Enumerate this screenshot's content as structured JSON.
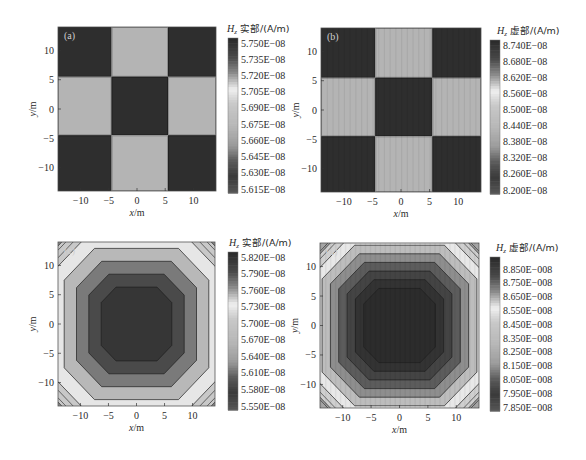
{
  "chart_data": [
    {
      "type": "heatmap",
      "panel": "(a)",
      "pattern": "checkerboard",
      "title": "",
      "xlabel": "x/m",
      "ylabel": "y/m",
      "xlim": [
        -14,
        14
      ],
      "ylim": [
        -14,
        14
      ],
      "xticks": [
        -10,
        -5,
        0,
        5,
        10
      ],
      "yticks": [
        10,
        5,
        0,
        -5,
        -10
      ],
      "colorbar": {
        "title_symbol": "H",
        "title_sub": "z",
        "title_text": " 实部/(A/m)",
        "ticks": [
          "5.750E−08",
          "5.735E−08",
          "5.720E−08",
          "5.705E−08",
          "5.690E−08",
          "5.675E−08",
          "5.660E−08",
          "5.645E−08",
          "5.630E−08",
          "5.615E−08"
        ],
        "min": 5.615e-08,
        "max": 5.75e-08
      },
      "cells": {
        "boundaries": [
          -14,
          -4.5,
          5.5,
          14
        ],
        "values": [
          [
            5.75e-08,
            5.69e-08,
            5.75e-08
          ],
          [
            5.69e-08,
            5.75e-08,
            5.69e-08
          ],
          [
            5.75e-08,
            5.69e-08,
            5.75e-08
          ]
        ]
      },
      "grid": false,
      "legend_position": "right (colorbar)"
    },
    {
      "type": "heatmap",
      "panel": "(b)",
      "pattern": "checkerboard",
      "xlabel": "x/m",
      "ylabel": "y/m",
      "xlim": [
        -14,
        14
      ],
      "ylim": [
        -14,
        14
      ],
      "xticks": [
        -10,
        -5,
        0,
        5,
        10
      ],
      "yticks": [
        10,
        5,
        0,
        -5,
        -10
      ],
      "colorbar": {
        "title_symbol": "H",
        "title_sub": "z",
        "title_text": " 虚部/(A/m)",
        "ticks": [
          "8.740E−08",
          "8.680E−08",
          "8.620E−08",
          "8.560E−08",
          "8.500E−08",
          "8.440E−08",
          "8.380E−08",
          "8.320E−08",
          "8.260E−08",
          "8.200E−08"
        ],
        "min": 8.2e-08,
        "max": 8.74e-08
      },
      "cells": {
        "boundaries": [
          -14,
          -4.5,
          5.5,
          14
        ],
        "values": [
          [
            8.74e-08,
            8.5e-08,
            8.74e-08
          ],
          [
            8.5e-08,
            8.74e-08,
            8.5e-08
          ],
          [
            8.74e-08,
            8.5e-08,
            8.74e-08
          ]
        ]
      },
      "grid": false,
      "legend_position": "right (colorbar)"
    },
    {
      "type": "heatmap",
      "panel": "(c)",
      "pattern": "octagonal contours",
      "xlabel": "x/m",
      "ylabel": "y/m",
      "xlim": [
        -14,
        14
      ],
      "ylim": [
        -14,
        14
      ],
      "xticks": [
        -10,
        -5,
        0,
        5,
        10
      ],
      "yticks": [
        10,
        5,
        0,
        -5,
        -10
      ],
      "colorbar": {
        "title_symbol": "H",
        "title_sub": "z",
        "title_text": " 实部/(A/m)",
        "ticks": [
          "5.820E−08",
          "5.790E−08",
          "5.760E−08",
          "5.730E−08",
          "5.700E−08",
          "5.670E−08",
          "5.640E−08",
          "5.610E−08",
          "5.580E−08",
          "5.550E−08"
        ],
        "min": 5.55e-08,
        "max": 5.82e-08
      },
      "contour_levels": 6,
      "center_value": 5.82e-08,
      "edge_value": 5.7e-08,
      "corner_value": 5.8e-08,
      "grid": false,
      "legend_position": "right (colorbar)"
    },
    {
      "type": "heatmap",
      "panel": "(d)",
      "pattern": "octagonal contours",
      "xlabel": "x/m",
      "ylabel": "y/m",
      "xlim": [
        -14,
        14
      ],
      "ylim": [
        -14,
        14
      ],
      "xticks": [
        -10,
        -5,
        0,
        5,
        10
      ],
      "yticks": [
        10,
        5,
        0,
        -5,
        -10
      ],
      "colorbar": {
        "title_symbol": "H",
        "title_sub": "z",
        "title_text": " 虚部/(A/m)",
        "ticks": [
          "8.850E−008",
          "8.750E−008",
          "8.650E−008",
          "8.550E−008",
          "8.450E−008",
          "8.350E−008",
          "8.250E−008",
          "8.150E−008",
          "8.050E−008",
          "7.950E−008",
          "7.850E−008"
        ],
        "min": 7.85e-08,
        "max": 8.9e-08
      },
      "contour_levels": 9,
      "center_value": 8.85e-08,
      "edge_value": 8.55e-08,
      "corner_value": 8.85e-08,
      "grid": false,
      "legend_position": "right (colorbar)"
    }
  ],
  "figure": {
    "panels": [
      {
        "label": "(a)",
        "box": [
          58,
          27,
          158,
          164
        ],
        "cbar": [
          228,
          38,
          10,
          155
        ],
        "cbar_title_xy": [
          227,
          32
        ]
      },
      {
        "label": "(b)",
        "box": [
          321,
          28,
          160,
          164
        ],
        "cbar": [
          490,
          40,
          10,
          154
        ],
        "cbar_title_xy": [
          497,
          34
        ]
      },
      {
        "label": "(c)",
        "box": [
          58,
          242,
          157,
          164
        ],
        "cbar": [
          228,
          252,
          10,
          158
        ],
        "cbar_title_xy": [
          229,
          246
        ]
      },
      {
        "label": "(d)",
        "box": [
          320,
          243,
          159,
          165
        ],
        "cbar": [
          490,
          257,
          10,
          154
        ],
        "cbar_title_xy": [
          496,
          251
        ]
      }
    ]
  }
}
